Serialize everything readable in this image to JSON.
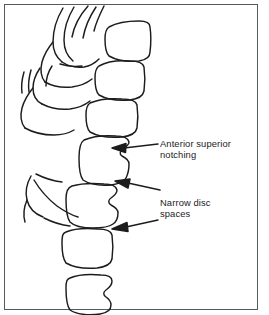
{
  "figure": {
    "kind": "medical-line-drawing",
    "frame_color": "#555a5e",
    "ink_color": "#1c1c1c",
    "background_color": "#ffffff"
  },
  "annotations": [
    {
      "id": "anterior-superior-notching",
      "text": "Anterior superior\nnotching",
      "line1": "Anterior superior",
      "line2": "notching"
    },
    {
      "id": "narrow-disc-spaces",
      "text": "Narrow disc\nspaces",
      "line1": "Narrow disc",
      "line2": "spaces"
    }
  ],
  "arrows": [
    {
      "id": "arrow-notching",
      "points_to": "anterior superior notch of vertebral body"
    },
    {
      "id": "arrow-disc-space-upper",
      "points_to": "upper narrowed disc space"
    },
    {
      "id": "arrow-disc-space-lower",
      "points_to": "lower narrowed disc space"
    }
  ],
  "structures": {
    "vertebral_bodies_count": 7,
    "posterior_elements": "spinous processes and laminae drawn as overlapping curved strokes on the left",
    "notch": "concave wedge on the anterior-superior corner of the fourth vertebral body"
  }
}
